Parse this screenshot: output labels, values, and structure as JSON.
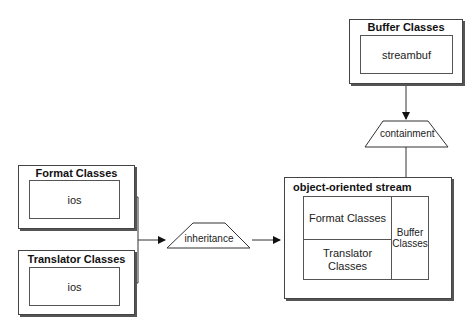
{
  "diagram": {
    "buffer_box": {
      "title": "Buffer Classes",
      "inner": "streambuf"
    },
    "containment": {
      "label": "containment"
    },
    "format_box": {
      "title": "Format Classes",
      "inner": "ios"
    },
    "translator_box": {
      "title": "Translator Classes",
      "inner": "ios"
    },
    "inheritance": {
      "label": "inheritance"
    },
    "stream_box": {
      "title": "object-oriented stream",
      "cells": {
        "format": "Format Classes",
        "translator": "Translator Classes",
        "buffer": "Buffer Classes"
      }
    }
  }
}
